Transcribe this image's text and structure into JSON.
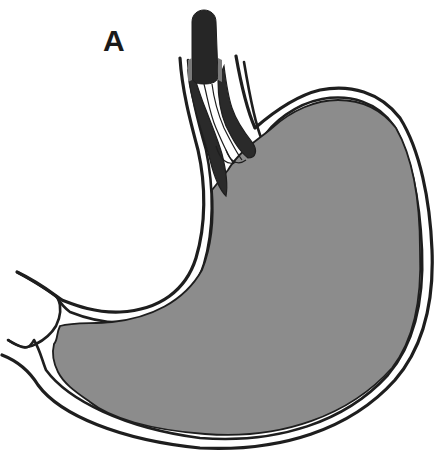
{
  "figure": {
    "panel_label": "A",
    "colors": {
      "background": "#ffffff",
      "stomach_fill": "#8c8c8c",
      "outline": "#1e1e1e",
      "endoscope": "#262626",
      "varices": "#2a2a2a",
      "band_shadow": "#7a7a7a"
    }
  }
}
